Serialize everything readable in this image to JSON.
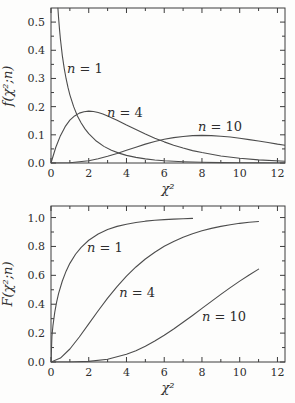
{
  "style": {
    "ink": "#3c3c3c",
    "curve_color": "#4d4d4d",
    "text_color": "#2e2e2e",
    "background": "#fdfdfc"
  },
  "chart_data": [
    {
      "type": "line",
      "title": "",
      "xlabel": "χ²",
      "ylabel": "f(χ²;n)",
      "xlim": [
        0,
        12.4
      ],
      "ylim": [
        0,
        0.55
      ],
      "grid": false,
      "legend_position": "inline-curve-labels",
      "xticks": {
        "major": [
          0,
          2,
          4,
          6,
          8,
          10,
          12
        ],
        "labels": [
          "0",
          "2",
          "4",
          "6",
          "8",
          "10",
          "12"
        ],
        "minor": [
          1,
          3,
          5,
          7,
          9,
          11
        ]
      },
      "yticks": {
        "major": [
          0,
          0.1,
          0.2,
          0.3,
          0.4,
          0.5
        ],
        "labels": [
          "0.0",
          "0.1",
          "0.2",
          "0.3",
          "0.4",
          "0.5"
        ],
        "minor": [
          0.05,
          0.15,
          0.25,
          0.35,
          0.45
        ]
      },
      "series": [
        {
          "id": "n1",
          "label": "n = 1",
          "label_at": [
            1.8,
            0.334
          ],
          "x": [
            0.365,
            0.4,
            0.45,
            0.5,
            0.6,
            0.7,
            0.8,
            0.9,
            1.0,
            1.2,
            1.4,
            1.6,
            1.8,
            2.0,
            2.4,
            2.8,
            3.2,
            3.6,
            4.0,
            4.5,
            5.0,
            5.5,
            6.0,
            7.0,
            8.0,
            9.0,
            10.0,
            11.0,
            12.4
          ],
          "y": [
            0.55,
            0.516,
            0.475,
            0.439,
            0.381,
            0.336,
            0.299,
            0.268,
            0.242,
            0.2,
            0.167,
            0.142,
            0.121,
            0.104,
            0.078,
            0.059,
            0.045,
            0.035,
            0.027,
            0.02,
            0.0147,
            0.0109,
            0.0081,
            0.0046,
            0.0026,
            0.0015,
            0.0009,
            0.0005,
            0.0002
          ]
        },
        {
          "id": "n4",
          "label": "n = 4",
          "label_at": [
            3.92,
            0.178
          ],
          "x": [
            0,
            0.25,
            0.5,
            0.75,
            1,
            1.25,
            1.5,
            1.75,
            2,
            2.25,
            2.5,
            2.75,
            3,
            3.5,
            4,
            4.5,
            5,
            5.5,
            6,
            6.5,
            7,
            7.5,
            8,
            9,
            10,
            11,
            12.4
          ],
          "y": [
            0,
            0.055,
            0.097,
            0.129,
            0.152,
            0.167,
            0.177,
            0.182,
            0.184,
            0.183,
            0.179,
            0.174,
            0.167,
            0.152,
            0.135,
            0.119,
            0.103,
            0.088,
            0.075,
            0.063,
            0.053,
            0.044,
            0.037,
            0.025,
            0.017,
            0.011,
            0.006
          ]
        },
        {
          "id": "n10",
          "label": "n = 10",
          "label_at": [
            8.96,
            0.128
          ],
          "x": [
            0,
            1,
            2,
            2.5,
            3,
            3.5,
            4,
            4.5,
            5,
            5.5,
            6,
            6.5,
            7,
            7.5,
            8,
            8.5,
            9,
            9.5,
            10,
            10.5,
            11,
            11.5,
            12,
            12.4
          ],
          "y": [
            0,
            0.001,
            0.008,
            0.015,
            0.024,
            0.034,
            0.045,
            0.056,
            0.067,
            0.076,
            0.084,
            0.09,
            0.094,
            0.097,
            0.098,
            0.097,
            0.095,
            0.092,
            0.088,
            0.083,
            0.078,
            0.073,
            0.067,
            0.063
          ]
        }
      ]
    },
    {
      "type": "line",
      "title": "",
      "xlabel": "χ²",
      "ylabel": "F(χ²;n)",
      "xlim": [
        0,
        12.4
      ],
      "ylim": [
        0,
        1.08
      ],
      "grid": false,
      "legend_position": "inline-curve-labels",
      "xticks": {
        "major": [
          0,
          2,
          4,
          6,
          8,
          10,
          12
        ],
        "labels": [
          "0",
          "2",
          "4",
          "6",
          "8",
          "10",
          "12"
        ],
        "minor": [
          1,
          3,
          5,
          7,
          9,
          11
        ]
      },
      "yticks": {
        "major": [
          0,
          0.2,
          0.4,
          0.6,
          0.8,
          1.0
        ],
        "labels": [
          "0.0",
          "0.2",
          "0.4",
          "0.6",
          "0.8",
          "1.0"
        ],
        "minor": [
          0.1,
          0.3,
          0.5,
          0.7,
          0.9
        ]
      },
      "series": [
        {
          "id": "n1",
          "label": "n = 1",
          "label_at": [
            2.86,
            0.79
          ],
          "x": [
            0,
            0.05,
            0.1,
            0.2,
            0.3,
            0.4,
            0.6,
            0.8,
            1.0,
            1.3,
            1.6,
            2.0,
            2.5,
            3.0,
            3.5,
            4.0,
            4.5,
            5.0,
            5.5,
            6.0,
            6.5,
            7.0,
            7.5
          ],
          "y": [
            0,
            0.178,
            0.248,
            0.345,
            0.416,
            0.473,
            0.561,
            0.629,
            0.683,
            0.746,
            0.794,
            0.843,
            0.886,
            0.917,
            0.939,
            0.954,
            0.966,
            0.975,
            0.981,
            0.986,
            0.989,
            0.992,
            0.994
          ]
        },
        {
          "id": "n4",
          "label": "n = 4",
          "label_at": [
            4.56,
            0.478
          ],
          "x": [
            0,
            0.5,
            1,
            1.5,
            2,
            2.5,
            3,
            3.5,
            4,
            4.5,
            5,
            5.5,
            6,
            6.5,
            7,
            7.5,
            8,
            8.5,
            9,
            9.5,
            10,
            10.5,
            11
          ],
          "y": [
            0,
            0.027,
            0.09,
            0.173,
            0.264,
            0.355,
            0.442,
            0.522,
            0.594,
            0.658,
            0.713,
            0.76,
            0.801,
            0.835,
            0.864,
            0.888,
            0.908,
            0.925,
            0.939,
            0.95,
            0.96,
            0.967,
            0.973
          ]
        },
        {
          "id": "n10",
          "label": "n = 10",
          "label_at": [
            9.17,
            0.312
          ],
          "x": [
            0,
            1,
            2,
            3,
            4,
            4.5,
            5,
            5.5,
            6,
            6.5,
            7,
            7.5,
            8,
            8.5,
            9,
            9.5,
            10,
            10.5,
            11
          ],
          "y": [
            0,
            0.0,
            0.004,
            0.019,
            0.053,
            0.078,
            0.109,
            0.145,
            0.185,
            0.228,
            0.275,
            0.322,
            0.371,
            0.42,
            0.468,
            0.515,
            0.56,
            0.602,
            0.643
          ]
        }
      ]
    }
  ]
}
